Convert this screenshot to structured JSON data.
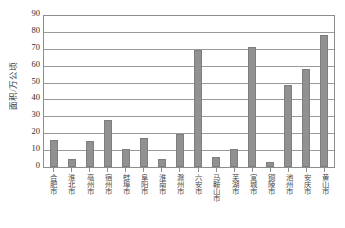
{
  "chart_data": {
    "type": "bar",
    "title": "",
    "xlabel": "",
    "ylabel": "面积/万公顷",
    "ylim": [
      0,
      90
    ],
    "ytick_step": 10,
    "yticks": [
      90,
      80,
      70,
      60,
      50,
      40,
      30,
      20,
      10,
      0
    ],
    "grid": "horizontal",
    "legend": "none",
    "bar_color": "#919191",
    "bar_border_color": "#7e7e7e",
    "categories": [
      "合肥市",
      "淮北市",
      "亳州市",
      "宿州市",
      "蚌埠市",
      "阜阳市",
      "淮南市",
      "滁州市",
      "六安市",
      "马鞍山市",
      "芜湖市",
      "宣城市",
      "铜陵市",
      "池州市",
      "安庆市",
      "黄山市"
    ],
    "values": [
      16.2,
      5.0,
      15.5,
      27.7,
      10.8,
      17.3,
      5.0,
      19.6,
      69.0,
      6.0,
      10.5,
      71.0,
      3.0,
      48.5,
      58.0,
      78.0
    ]
  }
}
